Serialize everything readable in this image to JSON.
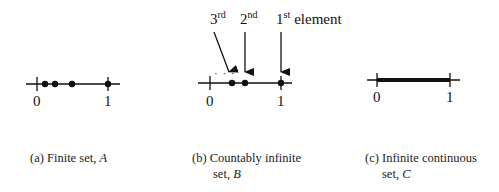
{
  "panels": [
    {
      "id": "a",
      "caption_prefix": "(a)",
      "caption_text": "Finite set,",
      "caption_var": "A",
      "axis": {
        "min_label": "0",
        "max_label": "1"
      },
      "points": [
        0.11,
        0.25,
        0.49,
        1.0
      ],
      "type": "discrete"
    },
    {
      "id": "b",
      "caption_prefix": "(b)",
      "caption_text": "Countably infinite",
      "caption_line2": "set,",
      "caption_var": "B",
      "axis": {
        "min_label": "0",
        "max_label": "1"
      },
      "points": [
        0.31,
        0.5,
        1.0
      ],
      "ellipsis": "· · ·",
      "annotations": [
        {
          "num": "3",
          "sup": "rd",
          "extra": ""
        },
        {
          "num": "2",
          "sup": "nd",
          "extra": ""
        },
        {
          "num": "1",
          "sup": "st",
          "extra": "element"
        }
      ],
      "type": "countable"
    },
    {
      "id": "c",
      "caption_prefix": "(c)",
      "caption_text": "Infinite continuous",
      "caption_line2": "set,",
      "caption_var": "C",
      "axis": {
        "min_label": "0",
        "max_label": "1"
      },
      "type": "continuous"
    }
  ]
}
